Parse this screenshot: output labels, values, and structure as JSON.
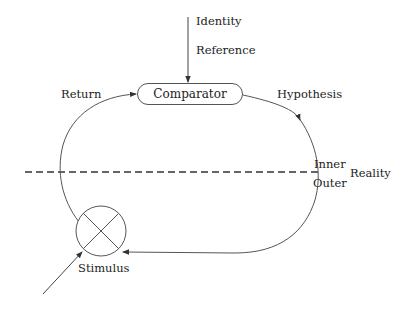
{
  "diagram": {
    "type": "feedback-loop",
    "nodes": {
      "comparator": {
        "label": "Comparator",
        "shape": "rounded-pill"
      },
      "stimulus": {
        "label": "Stimulus",
        "shape": "summing-junction-circle-x"
      }
    },
    "edges": {
      "reference_input": {
        "labels": [
          "Identity",
          "Reference"
        ],
        "from": "top",
        "to": "comparator"
      },
      "hypothesis": {
        "label": "Hypothesis",
        "from": "comparator",
        "to": "stimulus"
      },
      "return": {
        "label": "Return",
        "from": "stimulus",
        "to": "comparator"
      },
      "external_input": {
        "from": "outside",
        "to": "stimulus"
      }
    },
    "boundary": {
      "style": "dashed",
      "label": "Reality",
      "inner_label": "Inner",
      "outer_label": "Outer"
    },
    "colors": {
      "line": "#555555",
      "text": "#222222",
      "background": "#ffffff"
    }
  }
}
